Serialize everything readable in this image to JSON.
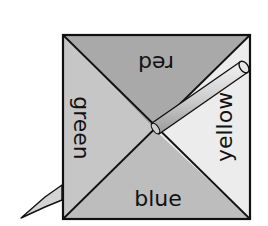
{
  "diagram": {
    "type": "spinner",
    "sections": [
      {
        "name": "red",
        "label": "red",
        "position": "top",
        "fill": "#a9a9a9"
      },
      {
        "name": "yellow",
        "label": "yellow",
        "position": "right",
        "fill": "#ececec"
      },
      {
        "name": "blue",
        "label": "blue",
        "position": "bottom",
        "fill": "#bdbdbd"
      },
      {
        "name": "green",
        "label": "green",
        "position": "left",
        "fill": "#c6c6c6"
      }
    ],
    "pointer": "pencil"
  }
}
